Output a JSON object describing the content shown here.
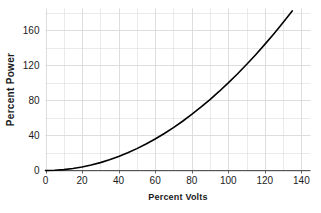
{
  "chart_data": {
    "type": "line",
    "title": "",
    "xlabel": "Percent Volts",
    "ylabel": "Percent Power",
    "xlim": [
      0,
      145
    ],
    "ylim": [
      0,
      185
    ],
    "xticks": [
      0,
      20,
      40,
      60,
      80,
      100,
      120,
      140
    ],
    "yticks": [
      0,
      40,
      80,
      120,
      160
    ],
    "grid": true,
    "grid_color": "#d9d9d9",
    "line_color": "#000000",
    "legend": "none",
    "relationship": "power = volts^2 / 100",
    "x": [
      0,
      5,
      10,
      15,
      20,
      25,
      30,
      35,
      40,
      45,
      50,
      55,
      60,
      65,
      70,
      75,
      80,
      85,
      90,
      95,
      100,
      105,
      110,
      115,
      120,
      125,
      130,
      135,
      140,
      143
    ],
    "values": [
      0,
      0.25,
      1,
      2.25,
      4,
      6.25,
      9,
      12.25,
      16,
      20.25,
      25,
      30.25,
      36,
      42.25,
      49,
      56.25,
      64,
      72.25,
      81,
      90.25,
      100,
      110.25,
      121,
      132.25,
      144,
      156.25,
      169,
      182.25,
      196,
      204.5
    ]
  },
  "axes": {
    "x_title": "Percent Volts",
    "y_title": "Percent Power",
    "x_tick_labels": [
      "0",
      "20",
      "40",
      "60",
      "80",
      "100",
      "120",
      "140"
    ],
    "y_tick_labels": [
      "0",
      "40",
      "80",
      "120",
      "160"
    ]
  }
}
